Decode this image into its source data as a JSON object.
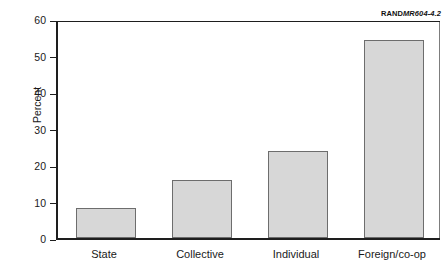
{
  "figure": {
    "id_prefix": "RAND",
    "id_number": "MR604-4.2"
  },
  "chart_data": {
    "type": "bar",
    "title": "",
    "subtitle": "",
    "xlabel": "",
    "ylabel": "Percent",
    "categories": [
      "State",
      "Collective",
      "Individual",
      "Foreign/co-op"
    ],
    "values": [
      8.3,
      15.8,
      23.8,
      54.3
    ],
    "series": [
      {
        "name": "Percent",
        "values": [
          8.3,
          15.8,
          23.8,
          54.3
        ]
      }
    ],
    "ylim": [
      0,
      60
    ],
    "yticks": [
      0,
      10,
      20,
      30,
      40,
      50,
      60
    ],
    "ytick_labels": [
      "0",
      "10",
      "20",
      "30",
      "40",
      "50",
      "60"
    ],
    "grid": false,
    "legend": false,
    "legend_position": "none",
    "bar_fill_color": "#d7d7d7",
    "bar_border_color": "#6d6d6d",
    "axis_color": "#1e1e1e"
  }
}
